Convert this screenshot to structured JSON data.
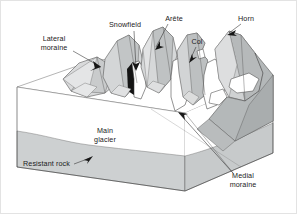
{
  "figure": {
    "projection": "oblique block diagram",
    "background_color": "#ffffff"
  },
  "palette": {
    "ice_white": "#ffffff",
    "slope_light_gray": "#d9dadb",
    "slope_mid_gray": "#c3c6c7",
    "rock_dark_gray": "#b0b4b5",
    "shadow_black": "#141414",
    "outline": "#3a3a3a",
    "text": "#1b1b1b",
    "frame": "#e3e3e3"
  },
  "labels": [
    {
      "id": "lateral-moraine",
      "line1": "Lateral",
      "line2": "moraine",
      "text_x": 53,
      "text_y1": 40,
      "text_y2": 49,
      "anchor": "middle",
      "leader": "M 72 50 L 100 66",
      "arrow_at": [
        100,
        66
      ],
      "arrow_angle": 30
    },
    {
      "id": "snowfield",
      "line1": "Snowfield",
      "line2": "",
      "text_x": 124,
      "text_y1": 26,
      "text_y2": 0,
      "anchor": "middle",
      "leader": "M 133 30 L 135 67",
      "arrow_at": [
        135,
        69
      ],
      "arrow_angle": 88
    },
    {
      "id": "arete",
      "line1": "Arête",
      "line2": "",
      "text_x": 173,
      "text_y1": 20,
      "text_y2": 0,
      "anchor": "middle",
      "leader": "M 167 23 L 155 46",
      "arrow_at": [
        154,
        48
      ],
      "arrow_angle": 118
    },
    {
      "id": "col",
      "line1": "Col",
      "line2": "",
      "text_x": 196,
      "text_y1": 43,
      "text_y2": 0,
      "anchor": "middle",
      "leader": "M 195 46 L 189 59",
      "arrow_at": [
        188,
        61
      ],
      "arrow_angle": 115
    },
    {
      "id": "horn",
      "line1": "Horn",
      "line2": "",
      "text_x": 245,
      "text_y1": 20,
      "text_y2": 0,
      "anchor": "middle",
      "leader": "M 240 23 L 228 32",
      "arrow_at": [
        227,
        33
      ],
      "arrow_angle": 145
    },
    {
      "id": "main-glacier",
      "line1": "Main",
      "line2": "glacier",
      "text_x": 104,
      "text_y1": 132,
      "text_y2": 141,
      "anchor": "middle",
      "leader": "",
      "arrow_at": null,
      "arrow_angle": 0
    },
    {
      "id": "resistant-rock",
      "line1": "Resistant rock",
      "line2": "",
      "text_x": 22,
      "text_y1": 165,
      "text_y2": 0,
      "anchor": "start",
      "leader": "M 73 163 L 89 157",
      "arrow_at": [
        91,
        156
      ],
      "arrow_angle": -20
    },
    {
      "id": "medial-moraine",
      "line1": "Medial",
      "line2": "moraine",
      "text_x": 242,
      "text_y1": 177,
      "text_y2": 186,
      "anchor": "middle",
      "leader": "M 232 172 L 178 114",
      "arrow_at": [
        176,
        112
      ],
      "arrow_angle": 228
    }
  ],
  "legend_semantics": {
    "lateral_moraine": "Debris ridge along glacier margin",
    "snowfield": "Accumulation basin / cirque",
    "arete": "Sharp ridge between two cirques",
    "col": "Low saddle / pass in an arête",
    "horn": "Pyramidal peak carved by cirques",
    "main_glacier": "Trunk valley glacier",
    "resistant_rock": "Bedrock layer beneath the ice",
    "medial_moraine": "Debris band formed where glaciers merge"
  }
}
